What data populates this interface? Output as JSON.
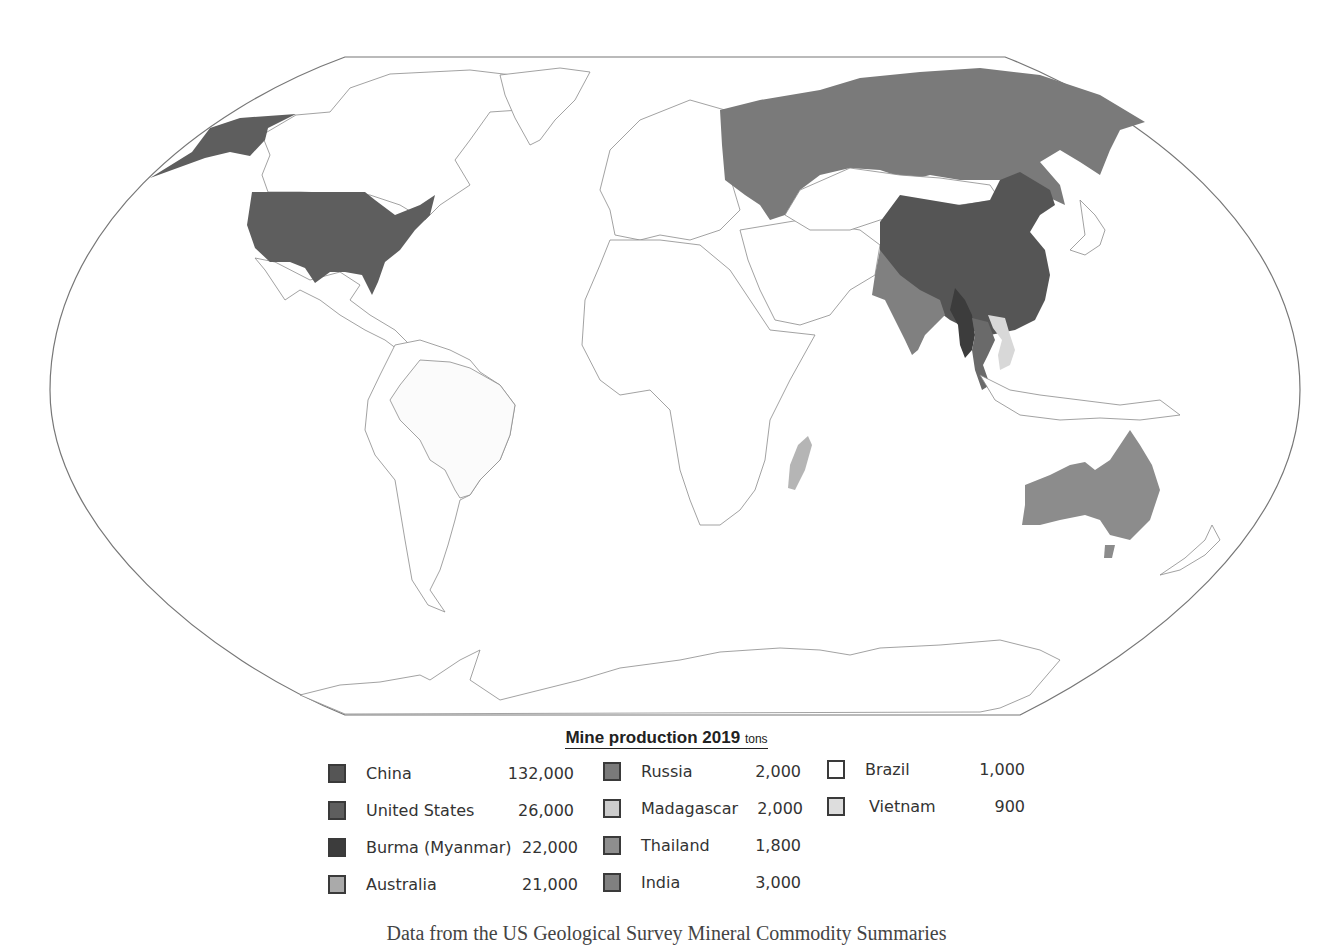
{
  "legend": {
    "title": "Mine production 2019",
    "unit": "tons",
    "columns": [
      [
        {
          "country": "China",
          "value": "132,000",
          "color": "#555555"
        },
        {
          "country": "United States",
          "value": "26,000",
          "color": "#5e5e5e"
        },
        {
          "country": "Burma (Myanmar)",
          "value": "22,000",
          "color": "#3c3c3c"
        },
        {
          "country": "Australia",
          "value": "21,000",
          "color": "#aaaaaa"
        }
      ],
      [
        {
          "country": "Russia",
          "value": "2,000",
          "color": "#7a7a7a"
        },
        {
          "country": "Madagascar",
          "value": "2,000",
          "color": "#cccccc"
        },
        {
          "country": "Thailand",
          "value": "1,800",
          "color": "#8e8e8e"
        },
        {
          "country": "India",
          "value": "3,000",
          "color": "#808080"
        }
      ],
      [
        {
          "country": "Brazil",
          "value": "1,000",
          "color": "#ffffff"
        },
        {
          "country": "Vietnam",
          "value": "900",
          "color": "#dddddd"
        }
      ]
    ]
  },
  "map": {
    "colors": {
      "china": "#555555",
      "united_states": "#5e5e5e",
      "burma": "#3c3c3c",
      "australia": "#8c8c8c",
      "russia": "#7a7a7a",
      "madagascar": "#b5b5b5",
      "thailand": "#6a6a6a",
      "india": "#808080",
      "brazil": "#fbfbfb",
      "vietnam": "#d8d8d8",
      "outline": "#8a8a8a"
    }
  },
  "caption": "Data from the US Geological Survey Mineral Commodity Summaries"
}
